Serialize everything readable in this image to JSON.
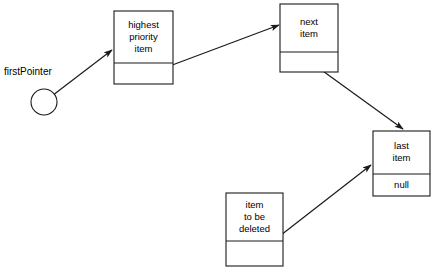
{
  "diagram": {
    "colors": {
      "stroke": "#1a1a1a",
      "background": "#ffffff",
      "text": "#000000"
    },
    "pointer": {
      "label": "firstPointer",
      "label_x": 4,
      "label_y": 72,
      "circle_cx": 44,
      "circle_cy": 102,
      "circle_r": 13
    },
    "nodes": [
      {
        "id": "highest-priority-item",
        "x": 114,
        "y": 11,
        "w": 59,
        "h": 73,
        "divider_y": 63,
        "lines": [
          "highest",
          "priority",
          "item"
        ],
        "lower_lines": []
      },
      {
        "id": "next-item",
        "x": 280,
        "y": 4,
        "w": 58,
        "h": 68,
        "divider_y": 52,
        "lines": [
          "next",
          "item"
        ],
        "lower_lines": []
      },
      {
        "id": "last-item",
        "x": 373,
        "y": 131,
        "w": 57,
        "h": 65,
        "divider_y": 174,
        "lines": [
          "last",
          "item"
        ],
        "lower_lines": [
          "null"
        ]
      },
      {
        "id": "item-to-be-deleted",
        "x": 226,
        "y": 193,
        "w": 57,
        "h": 73,
        "divider_y": 241,
        "lines": [
          "item",
          "to be",
          "deleted"
        ],
        "lower_lines": []
      }
    ],
    "arrows": [
      {
        "id": "firstpointer-to-highest-priority-item",
        "x1": 44,
        "y1": 102,
        "x2": 112,
        "y2": 50
      },
      {
        "id": "highest-priority-item-to-next-item",
        "x1": 151,
        "y1": 73,
        "x2": 279,
        "y2": 25
      },
      {
        "id": "next-item-to-last-item",
        "x1": 309,
        "y1": 61,
        "x2": 403,
        "y2": 129
      },
      {
        "id": "item-to-be-deleted-to-last-item",
        "x1": 254,
        "y1": 256,
        "x2": 371,
        "y2": 165
      }
    ]
  }
}
